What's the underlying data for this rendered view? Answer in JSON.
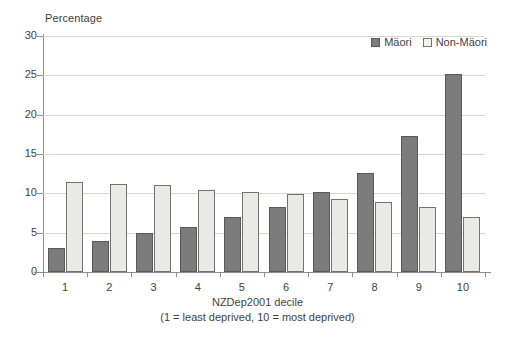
{
  "chart_data": {
    "type": "bar",
    "title": "",
    "ylabel": "Percentage",
    "xlabel": "NZDep2001 decile",
    "xlabel_note": "(1 = least deprived, 10 = most deprived)",
    "categories": [
      "1",
      "2",
      "3",
      "4",
      "5",
      "6",
      "7",
      "8",
      "9",
      "10"
    ],
    "series": [
      {
        "name": "Mäori",
        "color": "#7b7b7b",
        "values": [
          3.0,
          4.0,
          4.9,
          5.7,
          7.0,
          8.3,
          10.2,
          12.6,
          17.3,
          25.2
        ]
      },
      {
        "name": "Non-Mäori",
        "color": "#e9e9e6",
        "values": [
          11.4,
          11.2,
          11.1,
          10.4,
          10.2,
          9.9,
          9.3,
          8.9,
          8.3,
          7.0
        ]
      }
    ],
    "ylim": [
      0,
      30
    ],
    "yticks": [
      0,
      5,
      10,
      15,
      20,
      25,
      30
    ],
    "ytick_labels": [
      "0",
      "5",
      "10",
      "15",
      "20",
      "25",
      "30"
    ],
    "grid": true,
    "legend_position": "top-right"
  },
  "legend": {
    "entries": [
      {
        "label": "Mäori"
      },
      {
        "label": "Non-Mäori"
      }
    ]
  },
  "colors": {
    "maori_fill": "#7b7b7b",
    "maori_edge": "#5a5a5a",
    "nonmaori_fill": "#e9e9e6",
    "nonmaori_edge": "#737373",
    "gridline": "#d6d6d4",
    "axis": "#8d8d8d",
    "text": "#3f3f3f",
    "background": "#ffffff"
  }
}
